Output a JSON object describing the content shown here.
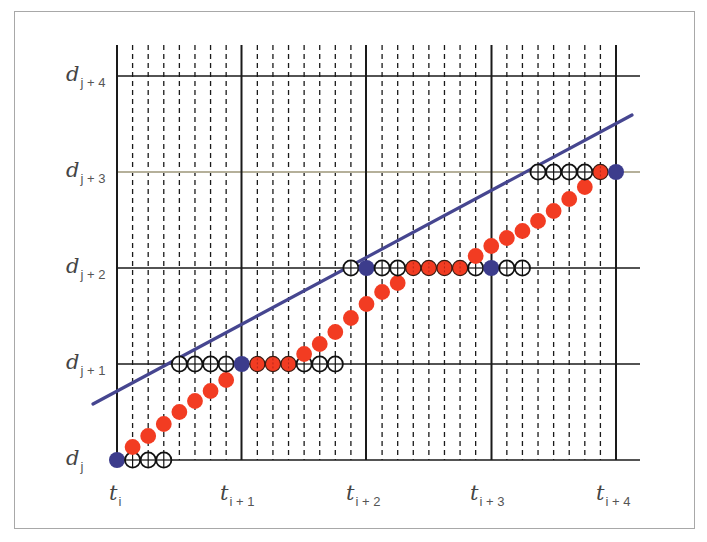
{
  "diagram": {
    "title": "",
    "colors": {
      "grid_major": "#1a1a1a",
      "grid_dashed": "#1a1a1a",
      "grid_highlight": "#b5b09a",
      "line": "#464690",
      "dot_blue": "#3c3c8c",
      "dot_red": "#f23c22",
      "dot_open_fill": "#ffffff",
      "dot_open_stroke": "#111111"
    },
    "x_labels": [
      {
        "base": "t",
        "sub": "i"
      },
      {
        "base": "t",
        "sub": "i + 1"
      },
      {
        "base": "t",
        "sub": "i + 2"
      },
      {
        "base": "t",
        "sub": "i + 3"
      },
      {
        "base": "t",
        "sub": "i + 4"
      }
    ],
    "y_labels": [
      {
        "base": "d",
        "sub": "j"
      },
      {
        "base": "d",
        "sub": "j + 1"
      },
      {
        "base": "d",
        "sub": "j + 2"
      },
      {
        "base": "d",
        "sub": "j + 3"
      },
      {
        "base": "d",
        "sub": "j + 4"
      }
    ],
    "subdivisions_per_interval": 8,
    "dots": [
      {
        "k": 0,
        "row": 0,
        "type": "blue"
      },
      {
        "k": 1,
        "row": 0,
        "type": "open"
      },
      {
        "k": 2,
        "row": 0,
        "type": "open"
      },
      {
        "k": 3,
        "row": 0,
        "type": "open"
      },
      {
        "k": 1,
        "y": 447,
        "type": "red"
      },
      {
        "k": 2,
        "y": 436,
        "type": "red"
      },
      {
        "k": 3,
        "y": 424,
        "type": "red"
      },
      {
        "k": 4,
        "y": 412,
        "type": "red"
      },
      {
        "k": 5,
        "y": 401,
        "type": "red"
      },
      {
        "k": 6,
        "y": 391,
        "type": "red"
      },
      {
        "k": 7,
        "y": 380,
        "type": "red"
      },
      {
        "k": 4,
        "row": 1,
        "type": "open"
      },
      {
        "k": 5,
        "row": 1,
        "type": "open"
      },
      {
        "k": 6,
        "row": 1,
        "type": "open"
      },
      {
        "k": 7,
        "row": 1,
        "type": "open"
      },
      {
        "k": 8,
        "row": 1,
        "type": "blue"
      },
      {
        "k": 9,
        "row": 1,
        "type": "red_outlined"
      },
      {
        "k": 10,
        "row": 1,
        "type": "red_outlined"
      },
      {
        "k": 11,
        "row": 1,
        "type": "red_outlined"
      },
      {
        "k": 12,
        "row": 1,
        "type": "open"
      },
      {
        "k": 13,
        "row": 1,
        "type": "open"
      },
      {
        "k": 14,
        "row": 1,
        "type": "open"
      },
      {
        "k": 12,
        "y": 354,
        "type": "red"
      },
      {
        "k": 13,
        "y": 344,
        "type": "red"
      },
      {
        "k": 14,
        "y": 332,
        "type": "red"
      },
      {
        "k": 15,
        "y": 318,
        "type": "red"
      },
      {
        "k": 16,
        "y": 304,
        "type": "red"
      },
      {
        "k": 17,
        "y": 292,
        "type": "red"
      },
      {
        "k": 18,
        "y": 283,
        "type": "red"
      },
      {
        "k": 15,
        "row": 2,
        "type": "open"
      },
      {
        "k": 16,
        "row": 2,
        "type": "blue"
      },
      {
        "k": 17,
        "row": 2,
        "type": "open"
      },
      {
        "k": 18,
        "row": 2,
        "type": "open"
      },
      {
        "k": 19,
        "row": 2,
        "type": "red_outlined"
      },
      {
        "k": 20,
        "row": 2,
        "type": "red_outlined"
      },
      {
        "k": 21,
        "row": 2,
        "type": "red_outlined"
      },
      {
        "k": 22,
        "row": 2,
        "type": "red_outlined"
      },
      {
        "k": 23,
        "row": 2,
        "type": "open"
      },
      {
        "k": 24,
        "row": 2,
        "type": "blue"
      },
      {
        "k": 25,
        "row": 2,
        "type": "open"
      },
      {
        "k": 26,
        "row": 2,
        "type": "open"
      },
      {
        "k": 23,
        "y": 256,
        "type": "red"
      },
      {
        "k": 24,
        "y": 246,
        "type": "red"
      },
      {
        "k": 25,
        "y": 238,
        "type": "red"
      },
      {
        "k": 26,
        "y": 231,
        "type": "red"
      },
      {
        "k": 27,
        "y": 221,
        "type": "red"
      },
      {
        "k": 28,
        "y": 211,
        "type": "red"
      },
      {
        "k": 29,
        "y": 199,
        "type": "red"
      },
      {
        "k": 30,
        "y": 187,
        "type": "red"
      },
      {
        "k": 27,
        "row": 3,
        "type": "open"
      },
      {
        "k": 28,
        "row": 3,
        "type": "open"
      },
      {
        "k": 29,
        "row": 3,
        "type": "open"
      },
      {
        "k": 30,
        "row": 3,
        "type": "open"
      },
      {
        "k": 31,
        "row": 3,
        "type": "red_outlined"
      },
      {
        "k": 32,
        "row": 3,
        "type": "blue"
      }
    ],
    "line": {
      "x1": 93,
      "y1": 404,
      "x2": 632,
      "y2": 115
    }
  }
}
